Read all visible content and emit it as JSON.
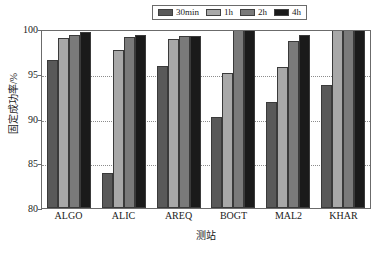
{
  "chart_data": {
    "type": "bar",
    "title": "",
    "subtitle": "",
    "xlabel": "测站",
    "ylabel": "固定成功率/%",
    "categories": [
      "ALGO",
      "ALIC",
      "AREQ",
      "BOGT",
      "MAL2",
      "KHAR"
    ],
    "series": [
      {
        "name": "30min",
        "color": "#595959",
        "values": [
          96.5,
          83.9,
          95.9,
          90.2,
          91.8,
          93.7
        ]
      },
      {
        "name": "1h",
        "color": "#a8a8a8",
        "values": [
          99.0,
          97.6,
          98.9,
          95.1,
          95.8,
          100.0
        ]
      },
      {
        "name": "2h",
        "color": "#7a7a7a",
        "values": [
          99.3,
          99.1,
          99.2,
          100.0,
          98.7,
          100.0
        ]
      },
      {
        "name": "4h",
        "color": "#1a1a1a",
        "values": [
          99.7,
          99.3,
          99.2,
          100.0,
          99.3,
          100.0
        ]
      }
    ],
    "ylim": [
      80,
      100
    ],
    "yticks": [
      100,
      95,
      90,
      85,
      80
    ],
    "ytick_labels": [
      "100",
      "95",
      "90",
      "85",
      "80"
    ],
    "grid": true,
    "grid_style": "dotted",
    "grid_axis": "y",
    "legend_position": "top-center",
    "legend_entries": [
      "30min",
      "1h",
      "2h",
      "4h"
    ]
  },
  "axis_colors": {
    "frame": "#6b6b6b",
    "grid": "#8c8c8c",
    "text": "#1a1a1a",
    "background": "#ffffff"
  }
}
